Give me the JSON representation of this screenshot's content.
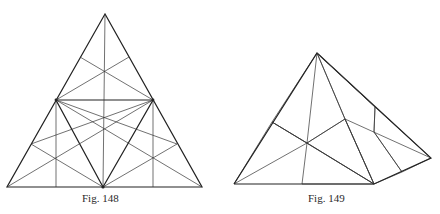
{
  "figures": [
    {
      "id": "fig148",
      "caption": "Fig. 148",
      "description": "Equilateral triangle subdivided by medians and midpoint triangle"
    },
    {
      "id": "fig149",
      "caption": "Fig. 149",
      "description": "Folded tetrahedral net with hatched and stippled faces"
    }
  ],
  "colors": {
    "ink": "#222222",
    "background": "#ffffff"
  }
}
